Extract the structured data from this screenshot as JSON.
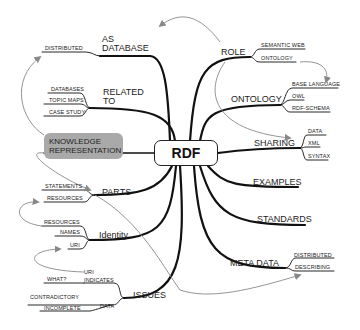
{
  "center": {
    "label": "RDF"
  },
  "highlight": {
    "line1": "KNOWLEDGE",
    "line2": "REPRESENTATION"
  },
  "branches": {
    "as_database": {
      "line1": "AS",
      "line2": "DATABASE",
      "children": [
        "DISTRIBUTED"
      ]
    },
    "related_to": {
      "line1": "RELATED",
      "line2": "TO",
      "children": [
        "DATABASES",
        "TOPIC MAPS",
        "CASE STUDY"
      ]
    },
    "parts": {
      "label": "PARTS",
      "children": [
        "STATEMENTS",
        "RESOURCES"
      ]
    },
    "identity": {
      "label": "Identity",
      "children": [
        "RESOURCES",
        "NAMES",
        "URI"
      ]
    },
    "issues": {
      "label": "ISSUES",
      "children": {
        "uri_indicates": {
          "line1": "URI",
          "line2": "INDICATES",
          "children": [
            "WHAT?"
          ]
        },
        "data": {
          "label": "DATA",
          "children": [
            "CONTRADICTORY",
            "INCOMPLETE"
          ]
        }
      }
    },
    "role": {
      "label": "ROLE",
      "children": [
        "SEMANTIC  WEB",
        "ONTOLOGY"
      ]
    },
    "ontology": {
      "label": "ONTOLOGY",
      "children": [
        "BASE LANGUAGE",
        "OWL",
        "RDF-SCHEMA"
      ]
    },
    "sharing": {
      "label": "SHARING",
      "children": [
        "DATA",
        "XML",
        "SYNTAX"
      ]
    },
    "examples": {
      "label": "EXAMPLES"
    },
    "standards": {
      "label": "STANDARDS"
    },
    "meta_data": {
      "label": "META DATA",
      "children": [
        "DISTRIBUTED",
        "DESCRIBING"
      ]
    }
  },
  "colors": {
    "line": "#111111",
    "arrow": "#888888",
    "highlight_bg": "#a9a9a9"
  }
}
